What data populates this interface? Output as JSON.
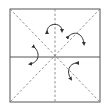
{
  "diagram": {
    "title": "",
    "type": "origami-fold-diagram",
    "colors": {
      "line": "#444444",
      "background": "#ffffff"
    },
    "square": {
      "x": 9,
      "y": 9,
      "w": 91,
      "h": 93
    },
    "creases": [
      {
        "kind": "valley-dashed",
        "from": "top-left",
        "to": "bottom-right"
      },
      {
        "kind": "valley-dashed",
        "from": "top-right",
        "to": "bottom-left"
      },
      {
        "kind": "valley-dashed",
        "from": "top-center",
        "to": "bottom-center"
      },
      {
        "kind": "solid",
        "from": "left-middle",
        "to": "right-middle"
      }
    ],
    "arrows": [
      {
        "name": "fold-arrow-top",
        "icon": "curved-arrow-icon"
      },
      {
        "name": "fold-arrow-upper-right",
        "icon": "curved-arrow-icon"
      },
      {
        "name": "fold-arrow-left",
        "icon": "curved-arrow-icon"
      },
      {
        "name": "fold-arrow-lower-right",
        "icon": "curved-arrow-icon"
      }
    ]
  }
}
